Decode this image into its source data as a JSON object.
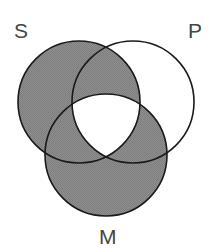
{
  "figure": {
    "kind": "venn-diagram",
    "title": "",
    "background_color": "#ffffff",
    "shade_color": "#8a8a8a",
    "unshaded_color": "#ffffff",
    "stroke_color": "#1a1a1a",
    "stroke_width": 1.6,
    "label_color": "#454545",
    "label_font_size": "21px"
  },
  "circles": [
    {
      "id": "S",
      "label": "S",
      "cx": 79,
      "cy": 102,
      "r": 61
    },
    {
      "id": "P",
      "label": "P",
      "cx": 133,
      "cy": 102,
      "r": 61
    },
    {
      "id": "M",
      "label": "M",
      "cx": 106,
      "cy": 155,
      "r": 61
    }
  ],
  "labels": {
    "s": "S",
    "p": "P",
    "m": "M"
  },
  "regions": [
    {
      "id": "S-only",
      "name": "S only",
      "shaded": true
    },
    {
      "id": "P-only",
      "name": "P only",
      "shaded": false
    },
    {
      "id": "M-only",
      "name": "M only",
      "shaded": true
    },
    {
      "id": "SP",
      "name": "S and P, not M",
      "shaded": true
    },
    {
      "id": "SM",
      "name": "S and M, not P",
      "shaded": true
    },
    {
      "id": "PM",
      "name": "P and M, not S",
      "shaded": true
    },
    {
      "id": "SPM",
      "name": "S and P and M",
      "shaded": false
    }
  ]
}
